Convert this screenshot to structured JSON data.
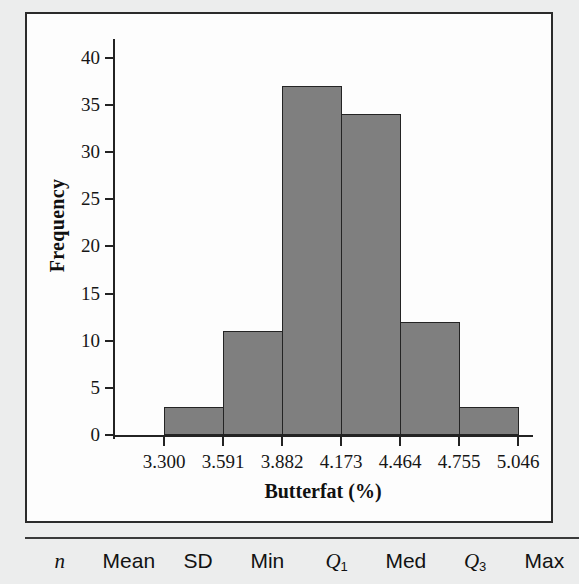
{
  "page": {
    "top_sliver_text": "",
    "background_color": "#eceded",
    "frame_color": "#2b2b2b",
    "bar_fill_color": "#7f7f7f",
    "bar_edge_color": "#242424"
  },
  "chart_data": {
    "type": "bar",
    "title": "",
    "subtitle": "",
    "xlabel": "Butterfat (%)",
    "ylabel": "Frequency",
    "categories": [
      "3.300-3.591",
      "3.591-3.882",
      "3.882-4.173",
      "4.173-4.464",
      "4.464-4.755",
      "4.755-5.046"
    ],
    "bin_edges": [
      3.3,
      3.591,
      3.882,
      4.173,
      4.464,
      4.755,
      5.046
    ],
    "bin_width": 0.291,
    "values": [
      3,
      11,
      37,
      34,
      12,
      3
    ],
    "total_count": 100,
    "xlim": [
      3.3,
      5.046
    ],
    "ylim": [
      0,
      42
    ],
    "x_tick_labels": [
      "3.300",
      "3.591",
      "3.882",
      "4.173",
      "4.464",
      "4.755",
      "5.046"
    ],
    "y_tick_labels": [
      "0",
      "5",
      "10",
      "15",
      "20",
      "25",
      "30",
      "35",
      "40"
    ],
    "y_tick_values": [
      0,
      5,
      10,
      15,
      20,
      25,
      30,
      35,
      40
    ],
    "grid": false,
    "legend": false,
    "legend_position": "none"
  },
  "stats_table": {
    "headers": [
      {
        "label": "n",
        "italic": true,
        "subscript": ""
      },
      {
        "label": "Mean",
        "italic": false,
        "subscript": ""
      },
      {
        "label": "SD",
        "italic": false,
        "subscript": ""
      },
      {
        "label": "Min",
        "italic": false,
        "subscript": ""
      },
      {
        "label": "Q",
        "italic": true,
        "subscript": "1"
      },
      {
        "label": "Med",
        "italic": false,
        "subscript": ""
      },
      {
        "label": "Q",
        "italic": true,
        "subscript": "3"
      },
      {
        "label": "Max",
        "italic": false,
        "subscript": ""
      }
    ]
  }
}
